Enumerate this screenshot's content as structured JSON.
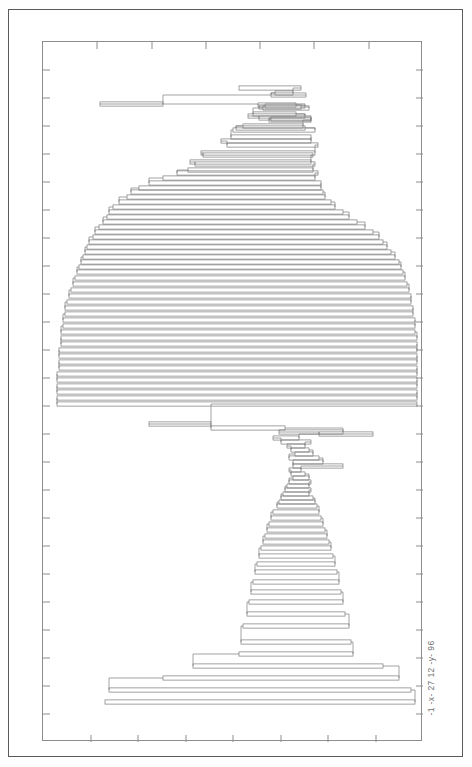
{
  "page": {
    "background_color": "#ffffff",
    "outer_frame_color": "#5a5a5a",
    "plot_frame_color": "#8d8d8d",
    "line_color": "#7b7b7b"
  },
  "axis_label": {
    "text": "-1 -x- 27 12 -y- 96",
    "rotation_degrees": -90,
    "position": "bottom-right-outside-plot"
  },
  "chart_data": {
    "type": "bar",
    "orientation": "horizontal",
    "title": "",
    "subtitle": "",
    "xlabel": "-1 -x- 27",
    "ylabel": "12 -y- 96",
    "xlim": [
      -1,
      27
    ],
    "ylim": [
      12,
      96
    ],
    "grid": false,
    "legend": "none",
    "axis_ticks": {
      "top_inner_ticks": 6,
      "bottom_inner_ticks": 7,
      "left_inner_ticks": 24,
      "right_inner_ticks": 24,
      "tick_length_px": 7,
      "labels_shown": false
    },
    "note": "Each datum is a horizontal span (bar) defined by x_start, x_end at a given row y. Values are read in plot-fraction units of the axis ranges.",
    "columns": [
      "y_row",
      "x_start",
      "x_end"
    ],
    "spans": [
      [
        46,
        196,
        258
      ],
      [
        51,
        232,
        250
      ],
      [
        53,
        228,
        263
      ],
      [
        62,
        57,
        120
      ],
      [
        63,
        215,
        253
      ],
      [
        64,
        222,
        262
      ],
      [
        65,
        216,
        258
      ],
      [
        66,
        220,
        266
      ],
      [
        72,
        210,
        253
      ],
      [
        74,
        205,
        262
      ],
      [
        76,
        216,
        268
      ],
      [
        77,
        228,
        268
      ],
      [
        78,
        226,
        268
      ],
      [
        84,
        200,
        260
      ],
      [
        86,
        193,
        262
      ],
      [
        88,
        190,
        272
      ],
      [
        95,
        188,
        268
      ],
      [
        99,
        178,
        268
      ],
      [
        103,
        184,
        275
      ],
      [
        111,
        158,
        272
      ],
      [
        113,
        160,
        270
      ],
      [
        120,
        147,
        268
      ],
      [
        122,
        152,
        272
      ],
      [
        128,
        145,
        270
      ],
      [
        131,
        134,
        275
      ],
      [
        136,
        120,
        272
      ],
      [
        141,
        106,
        278
      ],
      [
        146,
        96,
        278
      ],
      [
        150,
        88,
        280
      ],
      [
        155,
        84,
        282
      ],
      [
        160,
        76,
        288
      ],
      [
        165,
        70,
        292
      ],
      [
        170,
        66,
        300
      ],
      [
        175,
        64,
        306
      ],
      [
        180,
        60,
        314
      ],
      [
        185,
        56,
        322
      ],
      [
        190,
        52,
        330
      ],
      [
        195,
        50,
        336
      ],
      [
        200,
        46,
        340
      ],
      [
        205,
        44,
        344
      ],
      [
        210,
        42,
        348
      ],
      [
        215,
        40,
        352
      ],
      [
        220,
        38,
        356
      ],
      [
        225,
        36,
        358
      ],
      [
        230,
        34,
        360
      ],
      [
        236,
        32,
        362
      ],
      [
        242,
        30,
        364
      ],
      [
        248,
        28,
        366
      ],
      [
        254,
        26,
        368
      ],
      [
        260,
        24,
        368
      ],
      [
        266,
        22,
        370
      ],
      [
        272,
        22,
        370
      ],
      [
        278,
        20,
        372
      ],
      [
        284,
        20,
        372
      ],
      [
        290,
        18,
        372
      ],
      [
        296,
        18,
        374
      ],
      [
        302,
        18,
        374
      ],
      [
        308,
        16,
        374
      ],
      [
        314,
        16,
        374
      ],
      [
        320,
        16,
        374
      ],
      [
        326,
        16,
        374
      ],
      [
        332,
        14,
        374
      ],
      [
        338,
        14,
        374
      ],
      [
        344,
        14,
        374
      ],
      [
        350,
        14,
        374
      ],
      [
        356,
        14,
        374
      ],
      [
        362,
        14,
        374
      ],
      [
        382,
        106,
        168
      ],
      [
        386,
        168,
        242
      ],
      [
        390,
        236,
        300
      ],
      [
        392,
        276,
        330
      ],
      [
        396,
        230,
        256
      ],
      [
        400,
        238,
        268
      ],
      [
        404,
        244,
        262
      ],
      [
        408,
        248,
        266
      ],
      [
        412,
        252,
        270
      ],
      [
        416,
        246,
        276
      ],
      [
        420,
        250,
        280
      ],
      [
        424,
        250,
        300
      ],
      [
        428,
        246,
        258
      ],
      [
        432,
        248,
        262
      ],
      [
        436,
        250,
        266
      ],
      [
        440,
        246,
        268
      ],
      [
        444,
        244,
        266
      ],
      [
        448,
        242,
        268
      ],
      [
        452,
        240,
        266
      ],
      [
        456,
        238,
        270
      ],
      [
        460,
        236,
        272
      ],
      [
        464,
        234,
        274
      ],
      [
        470,
        230,
        276
      ],
      [
        476,
        228,
        278
      ],
      [
        482,
        226,
        280
      ],
      [
        488,
        224,
        282
      ],
      [
        494,
        222,
        284
      ],
      [
        500,
        220,
        286
      ],
      [
        506,
        218,
        288
      ],
      [
        514,
        216,
        290
      ],
      [
        522,
        214,
        292
      ],
      [
        530,
        212,
        294
      ],
      [
        540,
        210,
        296
      ],
      [
        550,
        208,
        298
      ],
      [
        560,
        206,
        300
      ],
      [
        572,
        204,
        302
      ],
      [
        584,
        200,
        306
      ],
      [
        600,
        198,
        308
      ],
      [
        612,
        196,
        310
      ],
      [
        624,
        150,
        340
      ],
      [
        636,
        120,
        356
      ],
      [
        648,
        66,
        368
      ],
      [
        660,
        62,
        372
      ]
    ]
  }
}
